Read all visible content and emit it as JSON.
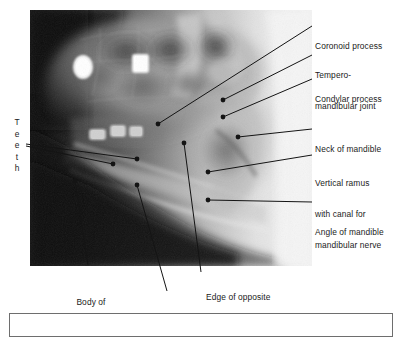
{
  "figure": {
    "image_alt": "X-ray radiograph of mandible, lateral oblique view"
  },
  "xray": {
    "name": "mandible-radiograph",
    "description": "Greyscale lateral oblique X-ray of the mandible showing teeth with radio-opaque fillings, body, ramus and condyle"
  },
  "teeth_label": {
    "text": "Teeth",
    "letters": [
      "T",
      "e",
      "e",
      "t",
      "h"
    ]
  },
  "labels": [
    {
      "id": "coronoid-process",
      "text": "Coronoid process",
      "lines": [
        "Coronoid process"
      ]
    },
    {
      "id": "temporomandibular-joint",
      "text": "Tempero-mandibular joint",
      "lines": [
        "Tempero-",
        "mandibular joint"
      ]
    },
    {
      "id": "condylar-process",
      "text": "Condylar process",
      "lines": [
        "Condylar process"
      ]
    },
    {
      "id": "neck-of-mandible",
      "text": "Neck of mandible",
      "lines": [
        "Neck of mandible"
      ]
    },
    {
      "id": "vertical-ramus",
      "text": "Vertical ramus with canal for mandibular nerve",
      "lines": [
        "Vertical ramus",
        "with canal for",
        "mandibular nerve"
      ]
    },
    {
      "id": "angle-of-mandible",
      "text": "Angle of mandible",
      "lines": [
        "Angle of mandible"
      ]
    },
    {
      "id": "body-of-mandible",
      "text": "Body of mandible",
      "lines": [
        "Body of",
        "mandible"
      ]
    },
    {
      "id": "horizontal-ramus",
      "text": "Horizontal ramus",
      "lines": [
        "Horizontal ramus"
      ]
    },
    {
      "id": "edge-of-opposite-side",
      "text": "Edge of opposite side of mandible",
      "lines": [
        "Edge of opposite",
        "side of mandible"
      ]
    }
  ],
  "colors": {
    "leader_line": "#141414",
    "dot": "#141414",
    "text": "#1b1b1b",
    "caption_border": "#6e6e6e",
    "background": "#ffffff"
  },
  "caption": {
    "text": ""
  }
}
